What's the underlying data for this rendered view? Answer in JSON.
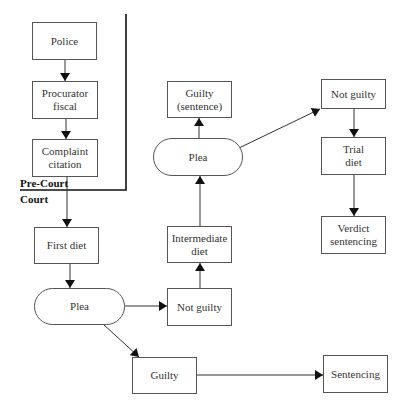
{
  "diagram": {
    "title": "",
    "zones": {
      "pre_court": "Pre-Court",
      "court": "Court"
    },
    "nodes": {
      "police": "Police",
      "procurator_fiscal": "Procurator\nfiscal",
      "complaint_citation": "Complaint\ncitation",
      "first_diet": "First diet",
      "plea_first": "Plea",
      "not_guilty_first": "Not guilty",
      "intermediate_diet": "Intermediate\ndiet",
      "plea_second": "Plea",
      "guilty_sentence": "Guilty\n(sentence)",
      "not_guilty_second": "Not guilty",
      "trial_diet": "Trial\ndiet",
      "verdict_sentencing": "Verdict\nsentencing",
      "guilty_first": "Guilty",
      "sentencing": "Sentencing"
    },
    "edges": [
      {
        "from": "Police",
        "to": "Procurator fiscal"
      },
      {
        "from": "Procurator fiscal",
        "to": "Complaint citation"
      },
      {
        "from": "Complaint citation",
        "to": "First diet"
      },
      {
        "from": "First diet",
        "to": "Plea"
      },
      {
        "from": "Plea",
        "to": "Not guilty"
      },
      {
        "from": "Plea",
        "to": "Guilty"
      },
      {
        "from": "Guilty",
        "to": "Sentencing"
      },
      {
        "from": "Not guilty",
        "to": "Intermediate diet"
      },
      {
        "from": "Intermediate diet",
        "to": "Plea"
      },
      {
        "from": "Plea",
        "to": "Guilty (sentence)"
      },
      {
        "from": "Plea",
        "to": "Not guilty"
      },
      {
        "from": "Not guilty",
        "to": "Trial diet"
      },
      {
        "from": "Trial diet",
        "to": "Verdict sentencing"
      }
    ],
    "colors": {
      "line": "#333333",
      "box_border": "#555555",
      "text": "#333333",
      "background": "#ffffff"
    }
  }
}
